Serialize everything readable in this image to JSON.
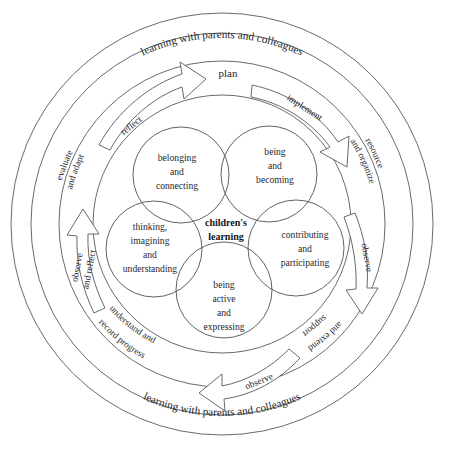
{
  "diagram": {
    "center_label_line1": "children's",
    "center_label_line2": "learning",
    "plan_label": "plan",
    "outer_ring_top_text": "learning with parents and colleagues",
    "outer_ring_bottom_text": "learning with parents and colleagues",
    "stroke_color": "#55595d",
    "text_color": "#26282b",
    "background_color": "#ffffff",
    "venn_circles": [
      {
        "id": "belonging",
        "lines": [
          "belonging",
          "and",
          "connecting"
        ]
      },
      {
        "id": "being-becoming",
        "lines": [
          "being",
          "and",
          "becoming"
        ]
      },
      {
        "id": "contributing",
        "lines": [
          "contributing",
          "and",
          "participating"
        ]
      },
      {
        "id": "being-active",
        "lines": [
          "being",
          "active",
          "and",
          "expressing"
        ]
      },
      {
        "id": "thinking",
        "lines": [
          "thinking,",
          "imagining",
          "and",
          "understanding"
        ]
      }
    ],
    "cycle_labels": [
      {
        "id": "evaluate-and-adapt",
        "line1": "evaluate",
        "line2": "and adapt"
      },
      {
        "id": "resource-and-organize",
        "line1": "resource",
        "line2": "and organize"
      },
      {
        "id": "support-and-extend",
        "line1": "support",
        "line2": "and extend"
      },
      {
        "id": "understand-and-record-progress",
        "line1": "understand and",
        "line2": "record progress"
      }
    ],
    "arrows": [
      {
        "id": "reflect",
        "label": "reflect"
      },
      {
        "id": "implement",
        "label": "implement"
      },
      {
        "id": "observe-right",
        "label": "observe"
      },
      {
        "id": "observe-bottom",
        "label": "observe"
      },
      {
        "id": "observe-and-reflect",
        "line1": "observe",
        "line2": "and reflect"
      }
    ]
  }
}
